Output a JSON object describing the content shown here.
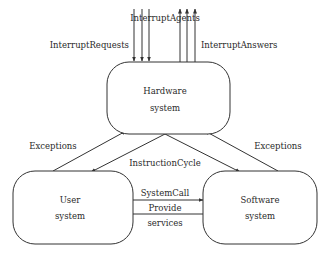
{
  "diagram": {
    "nodes": {
      "hardware": {
        "line1": "Hardware",
        "line2": "system"
      },
      "user": {
        "line1": "User",
        "line2": "system"
      },
      "software": {
        "line1": "Software",
        "line2": "system"
      }
    },
    "edges": {
      "interrupt_agents": "InterruptAgents",
      "interrupt_requests": "InterruptRequests",
      "interrupt_answers": "InterruptAnswers",
      "exceptions_left": "Exceptions",
      "exceptions_right": "Exceptions",
      "instruction_cycle": "InstructionCycle",
      "system_call": "SystemCall",
      "provide_services_line1": "Provide",
      "provide_services_line2": "services"
    },
    "colors": {
      "stroke": "#333333",
      "text": "#2a2a2a",
      "background": "#ffffff"
    }
  }
}
